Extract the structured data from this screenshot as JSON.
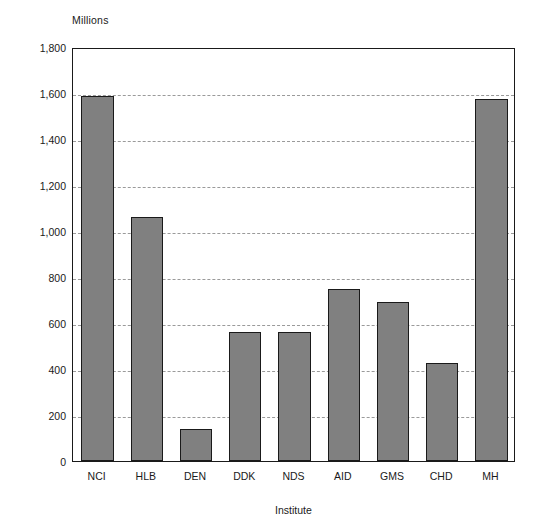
{
  "chart_data": {
    "type": "bar",
    "title": "",
    "subtitle": "",
    "xlabel": "Institute",
    "ylabel": "Millions",
    "y_unit_caption": "Millions",
    "categories": [
      "NCI",
      "HLB",
      "DEN",
      "DDK",
      "NDS",
      "AID",
      "GMS",
      "CHD",
      "MH"
    ],
    "values": [
      1585,
      1060,
      140,
      560,
      560,
      750,
      690,
      425,
      1575
    ],
    "ylim": [
      0,
      1800
    ],
    "ytick_values": [
      0,
      200,
      400,
      600,
      800,
      1000,
      1200,
      1400,
      1600,
      1800
    ],
    "ytick_labels": [
      "0",
      "200",
      "400",
      "600",
      "800",
      "1,000",
      "1,200",
      "1,400",
      "1,600",
      "1,800"
    ],
    "grid": true,
    "grid_axis": "y",
    "grid_style": "dashed",
    "legend": false,
    "legend_position": "none",
    "bar_color": "#808080",
    "bar_edge_color": "#1a1a1a",
    "gridline_color": "#9a9a9a",
    "axis_color": "#1a1a1a",
    "background_color": "#ffffff"
  }
}
